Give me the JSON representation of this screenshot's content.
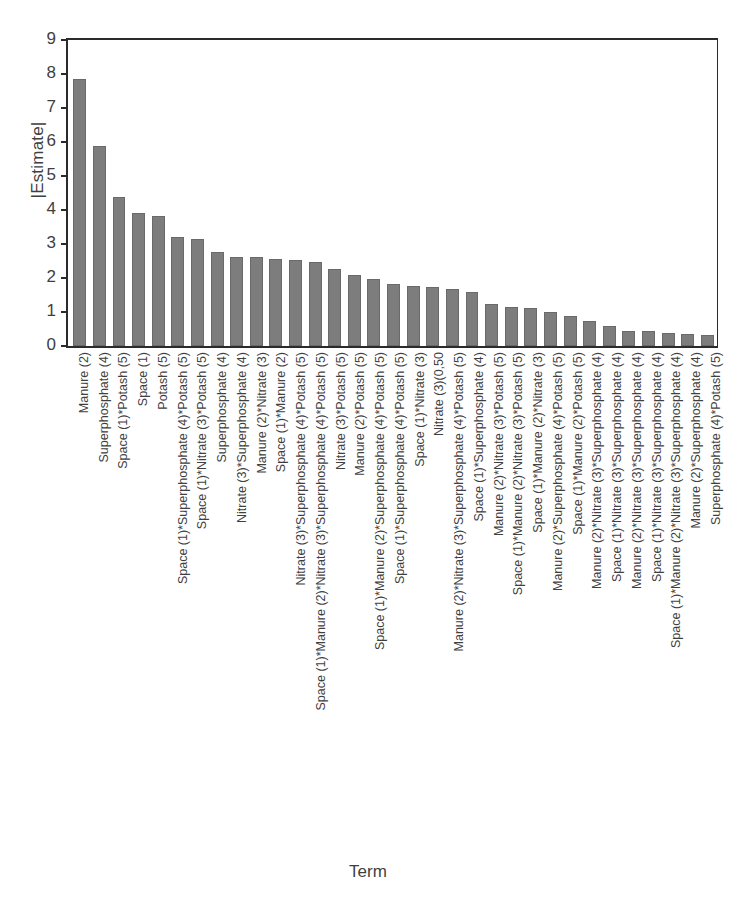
{
  "chart_data": {
    "type": "bar",
    "title": "",
    "xlabel": "Term",
    "ylabel": "|Estimate|",
    "ylim": [
      0,
      9
    ],
    "yticks": [
      0,
      1,
      2,
      3,
      4,
      5,
      6,
      7,
      8,
      9
    ],
    "grid": false,
    "legend": false,
    "bar_color": "#7d7d7d",
    "axis_color": "#2b2b2b",
    "categories": [
      "Manure (2)",
      "Superphosphate (4)",
      "Space (1)*Potash (5)",
      "Space (1)",
      "Potash (5)",
      "Space (1)*Superphosphate (4)*Potash (5)",
      "Space (1)*Nitrate (3)*Potash (5)",
      "Superphosphate (4)",
      "Nitrate (3)*Superphosphate (4)",
      "Manure (2)*Nitrate (3)",
      "Space (1)*Manure (2)",
      "Nitrate (3)*Superphosphate (4)*Potash (5)",
      "Space (1)*Manure (2)*Nitrate (3)*Superphosphate (4)*Potash (5)",
      "Nitrate (3)*Potash (5)",
      "Manure (2)*Potash (5)",
      "Space (1)*Manure (2)*Superphosphate (4)*Potash (5)",
      "Space (1)*Superphosphate (4)*Potash (5)",
      "Space (1)*Nitrate (3)",
      "Nitrate (3)(0,50",
      "Manure (2)*Nitrate (3)*Superphosphate (4)*Potash (5)",
      "Space (1)*Superphosphate (4)",
      "Manure (2)*Nitrate (3)*Potash (5)",
      "Space (1)*Manure (2)*Nitrate (3)*Potash (5)",
      "Space (1)*Manure (2)*Nitrate (3)",
      "Manure (2)*Superphosphate (4)*Potash (5)",
      "Space (1)*Manure (2)*Potash (5)",
      "Manure (2)*Nitrate (3)*Superphosphate (4)",
      "Space (1)*Nitrate (3)*Superphosphate (4)",
      "Manure (2)*Nitrate (3)*Superphosphate (4)",
      "Space (1)*Nitrate (3)*Superphosphate (4)",
      "Space (1)*Manure (2)*Nitrate (3)*Superphosphate (4)",
      "Manure (2)*Superphosphate (4)",
      "Superphosphate (4)*Potash (5)"
    ],
    "values": [
      7.85,
      5.87,
      4.38,
      3.92,
      3.83,
      3.22,
      3.16,
      2.76,
      2.63,
      2.63,
      2.57,
      2.52,
      2.48,
      2.27,
      2.08,
      1.98,
      1.82,
      1.76,
      1.74,
      1.68,
      1.6,
      1.24,
      1.16,
      1.12,
      1.0,
      0.88,
      0.74,
      0.6,
      0.45,
      0.43,
      0.38,
      0.34,
      0.33
    ]
  }
}
